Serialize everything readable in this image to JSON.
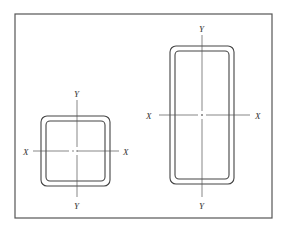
{
  "figure": {
    "frame": {
      "x": 15,
      "y": 14,
      "w": 257,
      "h": 204
    },
    "colors": {
      "line": "#444444",
      "frame": "#555555",
      "background": "#ffffff"
    }
  },
  "sections": [
    {
      "name": "square-tube",
      "outer": {
        "x": 41,
        "y": 116,
        "w": 69,
        "h": 70,
        "r": 6
      },
      "inner": {
        "x": 46,
        "y": 121,
        "w": 59,
        "h": 60,
        "r": 4
      },
      "center": {
        "x": 77,
        "y": 151
      },
      "x_axis": {
        "x1": 33,
        "x2": 119,
        "y": 151
      },
      "y_axis": {
        "x": 77,
        "y1": 100,
        "y2": 197
      },
      "labels": {
        "x_left": "X",
        "x_right": "X",
        "y_top": "Y",
        "y_bottom": "Y"
      }
    },
    {
      "name": "rectangular-tube",
      "outer": {
        "x": 170,
        "y": 46,
        "w": 64,
        "h": 138,
        "r": 6
      },
      "inner": {
        "x": 175,
        "y": 51,
        "w": 54,
        "h": 128,
        "r": 4
      },
      "center": {
        "x": 202,
        "y": 115
      },
      "x_axis": {
        "x1": 159,
        "x2": 250,
        "y": 115
      },
      "y_axis": {
        "x": 202,
        "y1": 35,
        "y2": 197
      },
      "labels": {
        "x_left": "X",
        "x_right": "X",
        "y_top": "Y",
        "y_bottom": "Y"
      }
    }
  ]
}
